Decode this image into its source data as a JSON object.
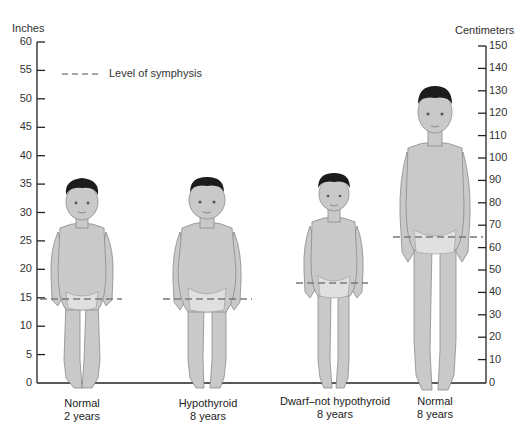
{
  "axes": {
    "left": {
      "title": "Inches",
      "ticks": [
        "60",
        "55",
        "50",
        "45",
        "40",
        "35",
        "30",
        "25",
        "20",
        "15",
        "10",
        "5",
        "0"
      ]
    },
    "right": {
      "title": "Centimeters",
      "ticks": [
        "150",
        "140",
        "130",
        "120",
        "110",
        "100",
        "90",
        "80",
        "70",
        "60",
        "50",
        "40",
        "30",
        "20",
        "10",
        "0"
      ]
    }
  },
  "legend": {
    "label": "Level of symphysis",
    "style": "dashed line"
  },
  "figures": [
    {
      "name": "normal-2-years",
      "line1": "Normal",
      "line2": "2 years",
      "height_in": 34,
      "symphysis_in": 14.8
    },
    {
      "name": "hypothyroid-8-years",
      "line1": "Hypothyroid",
      "line2": "8 years",
      "height_in": 34,
      "symphysis_in": 14.8
    },
    {
      "name": "dwarf-8-years",
      "line1": "Dwarf–not hypothyroid",
      "line2": "8 years",
      "height_in": 36,
      "symphysis_in": 17.5
    },
    {
      "name": "normal-8-years",
      "line1": "Normal",
      "line2": "8 years",
      "height_in": 52,
      "symphysis_in": 25.7
    }
  ],
  "colors": {
    "skin": "#c9c9c9",
    "skin_outline": "#8a8a8a",
    "hair": "#1c1c1c",
    "axis": "#222222",
    "dash": "#7a7a7a"
  }
}
